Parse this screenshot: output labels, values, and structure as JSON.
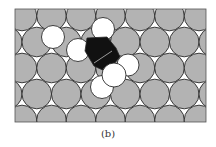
{
  "figure": {
    "caption": "(b)",
    "colors": {
      "background": "#ffffff",
      "substrate_atom": "#b3b3b3",
      "atom_outline": "#2a2a2a",
      "adsorbate_ring": "#111111",
      "adsorbate_h": "#ffffff",
      "bond_line": "#9a9a9a"
    },
    "frame": {
      "x": 15,
      "y": 9,
      "width": 191,
      "height": 113
    },
    "lattice": {
      "pitch": 29.5,
      "radius": 14.8,
      "rows": [
        {
          "y": 16,
          "x0": 22
        },
        {
          "y": 42,
          "x0": 7.25
        },
        {
          "y": 68,
          "x0": 22
        },
        {
          "y": 94,
          "x0": 7.25
        },
        {
          "y": 120,
          "x0": 22
        }
      ]
    },
    "adsorbate": {
      "ring_points": [
        [
          87,
          38
        ],
        [
          107,
          37
        ],
        [
          116,
          48
        ],
        [
          120,
          57
        ],
        [
          107,
          72
        ],
        [
          94,
          66
        ],
        [
          85,
          51
        ]
      ],
      "bond_line": [
        [
          94,
          63
        ],
        [
          112,
          51
        ]
      ],
      "white_atoms": [
        {
          "cx": 53,
          "cy": 37,
          "r": 11.5
        },
        {
          "cx": 78,
          "cy": 50,
          "r": 11.5
        },
        {
          "cx": 103,
          "cy": 29,
          "r": 11.5
        },
        {
          "cx": 128,
          "cy": 65,
          "r": 11
        },
        {
          "cx": 102,
          "cy": 87,
          "r": 11.5
        },
        {
          "cx": 114,
          "cy": 75,
          "r": 12
        }
      ]
    }
  }
}
